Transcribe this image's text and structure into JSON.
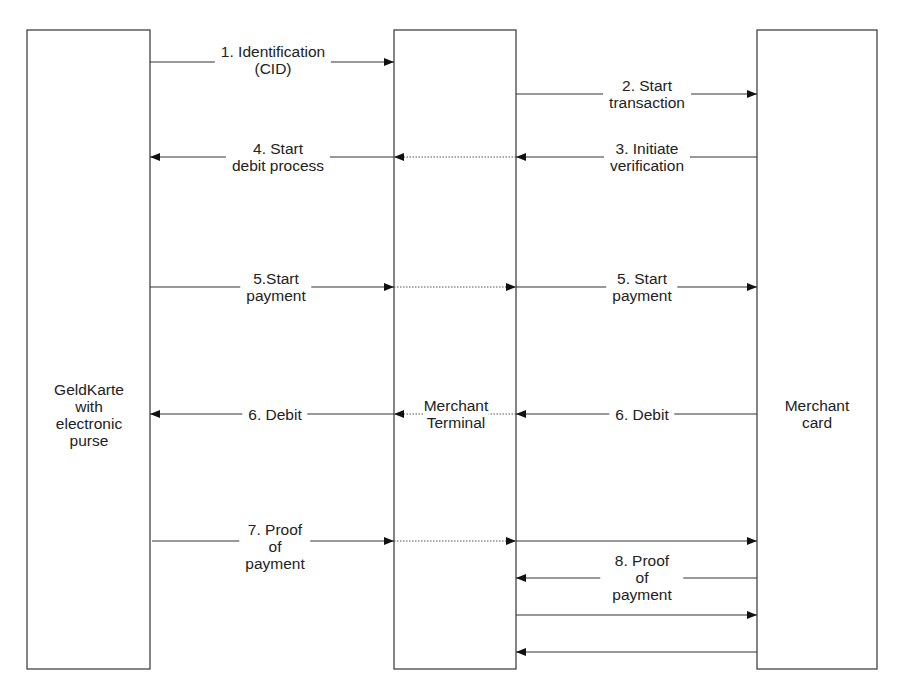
{
  "entities": [
    {
      "id": "geldkarte",
      "lines": [
        "GeldKarte",
        "with",
        "electronic",
        "purse"
      ]
    },
    {
      "id": "terminal",
      "lines": [
        "Merchant",
        "Terminal"
      ]
    },
    {
      "id": "merchant_card",
      "lines": [
        "Merchant",
        "card"
      ]
    }
  ],
  "messages": [
    {
      "step": "1",
      "lines": [
        "1. Identification",
        "(CID)"
      ],
      "from": "geldkarte",
      "to": "terminal"
    },
    {
      "step": "2",
      "lines": [
        "2. Start",
        "transaction"
      ],
      "from": "terminal",
      "to": "merchant_card"
    },
    {
      "step": "3",
      "lines": [
        "3. Initiate",
        "verification"
      ],
      "from": "merchant_card",
      "to": "terminal"
    },
    {
      "step": "4",
      "lines": [
        "4. Start",
        "debit process"
      ],
      "from": "terminal",
      "to": "geldkarte"
    },
    {
      "step": "5a",
      "lines": [
        "5.Start",
        "payment"
      ],
      "from": "geldkarte",
      "to": "terminal"
    },
    {
      "step": "5b",
      "lines": [
        "5. Start",
        "payment"
      ],
      "from": "terminal",
      "to": "merchant_card"
    },
    {
      "step": "6a",
      "lines": [
        "6. Debit"
      ],
      "from": "merchant_card",
      "to": "terminal"
    },
    {
      "step": "6b",
      "lines": [
        "6. Debit"
      ],
      "from": "terminal",
      "to": "geldkarte"
    },
    {
      "step": "7",
      "lines": [
        "7. Proof",
        "of",
        "payment"
      ],
      "from": "geldkarte",
      "to": "terminal"
    },
    {
      "step": "8",
      "lines": [
        "8. Proof",
        "of",
        "payment"
      ],
      "from": "terminal",
      "to": "merchant_card"
    }
  ]
}
